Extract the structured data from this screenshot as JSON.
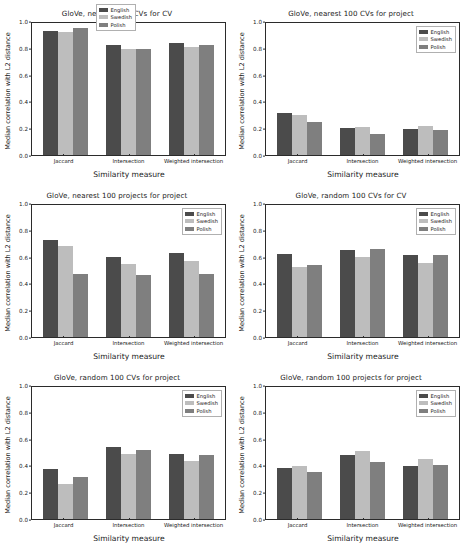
{
  "figure": {
    "background": "#ffffff",
    "rows": 3,
    "cols": 2,
    "series_colors": {
      "English": "#4b4b4b",
      "Swedish": "#bdbdbd",
      "Polish": "#7f7f7f"
    }
  },
  "common": {
    "xlabel": "Similarity measure",
    "ylabel": "Median correlation with L2 distance",
    "categories": [
      "Jaccard",
      "Intersection",
      "Weighted intersection"
    ],
    "legend_entries": [
      "English",
      "Swedish",
      "Polish"
    ],
    "yticks": [
      "0.0",
      "0.2",
      "0.4",
      "0.6",
      "0.8",
      "1.0"
    ],
    "ylim": [
      0,
      1
    ]
  },
  "chart_data": [
    {
      "type": "bar",
      "title": "GloVe, nearest 100 CVs for CV",
      "xlabel": "Similarity measure",
      "ylabel": "Median correlation with L2 distance",
      "categories": [
        "Jaccard",
        "Intersection",
        "Weighted intersection"
      ],
      "ylim": [
        0,
        1
      ],
      "yticks": [
        0.0,
        0.2,
        0.4,
        0.6,
        0.8,
        1.0
      ],
      "grid": false,
      "legend_position": "upper center",
      "series": [
        {
          "name": "English",
          "values": [
            0.94,
            0.83,
            0.85
          ]
        },
        {
          "name": "Swedish",
          "values": [
            0.935,
            0.805,
            0.82
          ]
        },
        {
          "name": "Polish",
          "values": [
            0.96,
            0.805,
            0.83
          ]
        }
      ]
    },
    {
      "type": "bar",
      "title": "GloVe, nearest 100 CVs for project",
      "xlabel": "Similarity measure",
      "ylabel": "Median correlation with L2 distance",
      "categories": [
        "Jaccard",
        "Intersection",
        "Weighted intersection"
      ],
      "ylim": [
        0,
        1
      ],
      "yticks": [
        0.0,
        0.2,
        0.4,
        0.6,
        0.8,
        1.0
      ],
      "grid": false,
      "legend_position": "upper right",
      "series": [
        {
          "name": "English",
          "values": [
            0.315,
            0.202,
            0.195
          ]
        },
        {
          "name": "Swedish",
          "values": [
            0.3,
            0.212,
            0.222
          ]
        },
        {
          "name": "Polish",
          "values": [
            0.253,
            0.162,
            0.19
          ]
        }
      ]
    },
    {
      "type": "bar",
      "title": "GloVe, nearest 100 projects for project",
      "xlabel": "Similarity measure",
      "ylabel": "Median correlation with L2 distance",
      "categories": [
        "Jaccard",
        "Intersection",
        "Weighted intersection"
      ],
      "ylim": [
        0,
        1
      ],
      "yticks": [
        0.0,
        0.2,
        0.4,
        0.6,
        0.8,
        1.0
      ],
      "grid": false,
      "legend_position": "upper right",
      "series": [
        {
          "name": "English",
          "values": [
            0.733,
            0.606,
            0.636
          ]
        },
        {
          "name": "Swedish",
          "values": [
            0.688,
            0.551,
            0.575
          ]
        },
        {
          "name": "Polish",
          "values": [
            0.481,
            0.472,
            0.481
          ]
        }
      ]
    },
    {
      "type": "bar",
      "title": "GloVe, random 100 CVs for CV",
      "xlabel": "Similarity measure",
      "ylabel": "Median correlation with L2 distance",
      "categories": [
        "Jaccard",
        "Intersection",
        "Weighted intersection"
      ],
      "ylim": [
        0,
        1
      ],
      "yticks": [
        0.0,
        0.2,
        0.4,
        0.6,
        0.8,
        1.0
      ],
      "grid": false,
      "legend_position": "upper right",
      "series": [
        {
          "name": "English",
          "values": [
            0.629,
            0.661,
            0.618
          ]
        },
        {
          "name": "Swedish",
          "values": [
            0.529,
            0.607,
            0.561
          ]
        },
        {
          "name": "Polish",
          "values": [
            0.545,
            0.663,
            0.625
          ]
        }
      ]
    },
    {
      "type": "bar",
      "title": "GloVe, random 100 CVs for project",
      "xlabel": "Similarity measure",
      "ylabel": "Median correlation with L2 distance",
      "categories": [
        "Jaccard",
        "Intersection",
        "Weighted intersection"
      ],
      "ylim": [
        0,
        1
      ],
      "yticks": [
        0.0,
        0.2,
        0.4,
        0.6,
        0.8,
        1.0
      ],
      "grid": false,
      "legend_position": "upper right",
      "series": [
        {
          "name": "English",
          "values": [
            0.378,
            0.549,
            0.489
          ]
        },
        {
          "name": "Swedish",
          "values": [
            0.265,
            0.489,
            0.44
          ]
        },
        {
          "name": "Polish",
          "values": [
            0.32,
            0.524,
            0.486
          ]
        }
      ]
    },
    {
      "type": "bar",
      "title": "GloVe, random 100 projects for project",
      "xlabel": "Similarity measure",
      "ylabel": "Median correlation with L2 distance",
      "categories": [
        "Jaccard",
        "Intersection",
        "Weighted intersection"
      ],
      "ylim": [
        0,
        1
      ],
      "yticks": [
        0.0,
        0.2,
        0.4,
        0.6,
        0.8,
        1.0
      ],
      "grid": false,
      "legend_position": "upper right",
      "series": [
        {
          "name": "English",
          "values": [
            0.389,
            0.484,
            0.404
          ]
        },
        {
          "name": "Swedish",
          "values": [
            0.402,
            0.515,
            0.454
          ]
        },
        {
          "name": "Polish",
          "values": [
            0.359,
            0.434,
            0.407
          ]
        }
      ]
    }
  ]
}
